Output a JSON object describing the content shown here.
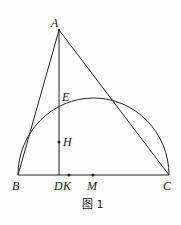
{
  "caption": "图 1",
  "points": {
    "A": "A",
    "B": "B",
    "C": "C",
    "D": "D",
    "K": "K",
    "M": "M",
    "E": "E",
    "H": "H"
  },
  "figure": {
    "segments": [
      "AB",
      "AC",
      "BC",
      "AD"
    ],
    "arc": "semicircle with diameter BC, center M",
    "marked_points": [
      "H",
      "K",
      "M"
    ]
  }
}
